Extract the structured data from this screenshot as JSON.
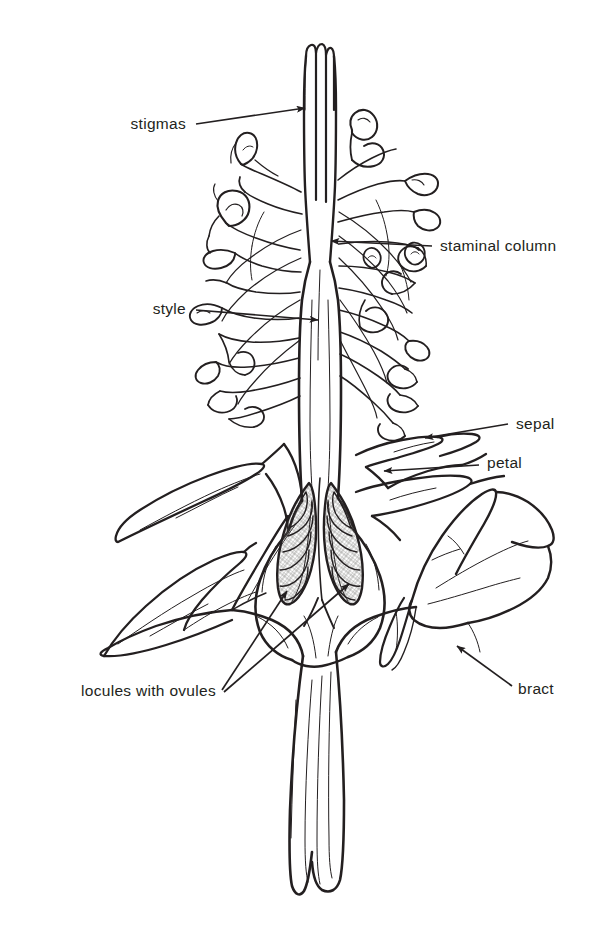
{
  "figure": {
    "background_color": "#ffffff",
    "ink_color": "#231f20",
    "style": "line-drawing"
  },
  "labels": {
    "stigmas": "stigmas",
    "staminal_column": "staminal column",
    "style": "style",
    "sepal": "sepal",
    "petal": "petal",
    "locules_with_ovules": "locules with ovules",
    "bract": "bract"
  },
  "label_items": [
    {
      "id": "stigmas",
      "text": "stigmas",
      "anchor": "end",
      "x": 186,
      "y": 129,
      "arrow_to_x": 305,
      "arrow_to_y": 110
    },
    {
      "id": "staminal-column",
      "text": "staminal column",
      "anchor": "start",
      "x": 440,
      "y": 251,
      "arrow_to_x": 330,
      "arrow_to_y": 241
    },
    {
      "id": "style",
      "text": "style",
      "anchor": "end",
      "x": 186,
      "y": 314,
      "arrow_to_x": 318,
      "arrow_to_y": 321
    },
    {
      "id": "sepal",
      "text": "sepal",
      "anchor": "start",
      "x": 516,
      "y": 429,
      "arrow_to_x": 424,
      "arrow_to_y": 439
    },
    {
      "id": "petal",
      "text": "petal",
      "anchor": "start",
      "x": 487,
      "y": 468,
      "arrow_to_x": 383,
      "arrow_to_y": 471
    },
    {
      "id": "locules-with-ovules",
      "text": "locules with ovules",
      "anchor": "end",
      "x": 216,
      "y": 696,
      "arrow_to_x": 287,
      "arrow_to_y": 592
    },
    {
      "id": "bract",
      "text": "bract",
      "anchor": "start",
      "x": 518,
      "y": 694,
      "arrow_to_x": 456,
      "arrow_to_y": 645
    }
  ],
  "anatomy_parts": [
    "stigmas",
    "style",
    "staminal column",
    "anthers",
    "filaments",
    "sepal",
    "petal",
    "bract",
    "ovary",
    "locules with ovules",
    "pedicel"
  ]
}
